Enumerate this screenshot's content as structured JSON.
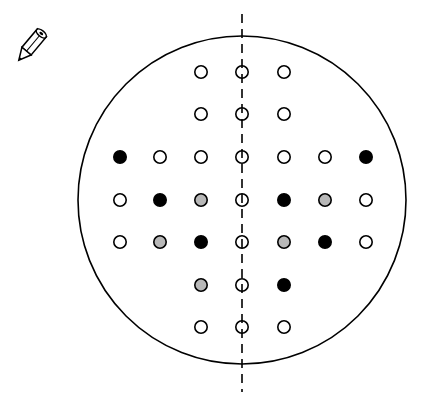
{
  "diagram": {
    "icon": "pencil-icon",
    "field_circle": {
      "cx": 242,
      "cy": 200,
      "r": 164,
      "stroke": "#000000"
    },
    "midline": {
      "x": 242,
      "y1": 14,
      "y2": 392,
      "style": "dashed"
    },
    "colors": {
      "open": "#ffffff",
      "filled": "#000000",
      "gray": "#b8b8b8",
      "stroke": "#000000"
    },
    "columns_x": [
      120,
      160,
      201,
      242,
      284,
      325,
      366
    ],
    "rows_y": [
      72,
      114,
      157,
      200,
      242,
      285,
      327
    ],
    "dots": [
      {
        "row": 0,
        "col": 2,
        "state": "open"
      },
      {
        "row": 0,
        "col": 3,
        "state": "open"
      },
      {
        "row": 0,
        "col": 4,
        "state": "open"
      },
      {
        "row": 1,
        "col": 2,
        "state": "open"
      },
      {
        "row": 1,
        "col": 3,
        "state": "open"
      },
      {
        "row": 1,
        "col": 4,
        "state": "open"
      },
      {
        "row": 2,
        "col": 0,
        "state": "filled"
      },
      {
        "row": 2,
        "col": 1,
        "state": "open"
      },
      {
        "row": 2,
        "col": 2,
        "state": "open"
      },
      {
        "row": 2,
        "col": 3,
        "state": "open"
      },
      {
        "row": 2,
        "col": 4,
        "state": "open"
      },
      {
        "row": 2,
        "col": 5,
        "state": "open"
      },
      {
        "row": 2,
        "col": 6,
        "state": "filled"
      },
      {
        "row": 3,
        "col": 0,
        "state": "open"
      },
      {
        "row": 3,
        "col": 1,
        "state": "filled"
      },
      {
        "row": 3,
        "col": 2,
        "state": "gray"
      },
      {
        "row": 3,
        "col": 3,
        "state": "open"
      },
      {
        "row": 3,
        "col": 4,
        "state": "filled"
      },
      {
        "row": 3,
        "col": 5,
        "state": "gray"
      },
      {
        "row": 3,
        "col": 6,
        "state": "open"
      },
      {
        "row": 4,
        "col": 0,
        "state": "open"
      },
      {
        "row": 4,
        "col": 1,
        "state": "gray"
      },
      {
        "row": 4,
        "col": 2,
        "state": "filled"
      },
      {
        "row": 4,
        "col": 3,
        "state": "open"
      },
      {
        "row": 4,
        "col": 4,
        "state": "gray"
      },
      {
        "row": 4,
        "col": 5,
        "state": "filled"
      },
      {
        "row": 4,
        "col": 6,
        "state": "open"
      },
      {
        "row": 5,
        "col": 2,
        "state": "gray"
      },
      {
        "row": 5,
        "col": 3,
        "state": "open"
      },
      {
        "row": 5,
        "col": 4,
        "state": "filled"
      },
      {
        "row": 6,
        "col": 2,
        "state": "open"
      },
      {
        "row": 6,
        "col": 3,
        "state": "open"
      },
      {
        "row": 6,
        "col": 4,
        "state": "open"
      }
    ]
  }
}
